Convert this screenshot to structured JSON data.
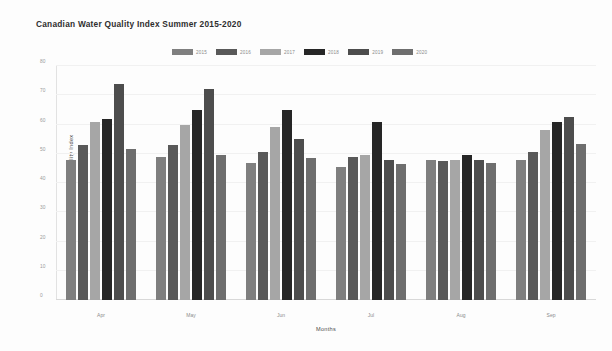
{
  "chart_data": {
    "type": "bar",
    "title": "Canadian Water Quality Index Summer 2015-2020",
    "xlabel": "Months",
    "ylabel": "Canadian Water Quality Index",
    "categories": [
      "Apr",
      "May",
      "Jun",
      "Jul",
      "Aug",
      "Sep"
    ],
    "ylim": [
      0,
      80
    ],
    "yticks": [
      0,
      10,
      20,
      30,
      40,
      50,
      60,
      70,
      80
    ],
    "grid": true,
    "legend_position": "top-center",
    "series": [
      {
        "name": "2015",
        "color": "#7f7f7f",
        "values": [
          48,
          49,
          47,
          45.5,
          48,
          48
        ]
      },
      {
        "name": "2016",
        "color": "#595959",
        "values": [
          53,
          53,
          50.5,
          49,
          47.5,
          50.5
        ]
      },
      {
        "name": "2017",
        "color": "#a6a6a6",
        "values": [
          61,
          60,
          59,
          49.5,
          48,
          58
        ]
      },
      {
        "name": "2018",
        "color": "#262626",
        "values": [
          62,
          65,
          65,
          61,
          49.5,
          61
        ]
      },
      {
        "name": "2019",
        "color": "#4d4d4d",
        "values": [
          74,
          72,
          55,
          48,
          48,
          62.5
        ]
      },
      {
        "name": "2020",
        "color": "#6e6e6e",
        "values": [
          51.5,
          49.5,
          48.5,
          46.5,
          47,
          53.5
        ]
      }
    ]
  }
}
